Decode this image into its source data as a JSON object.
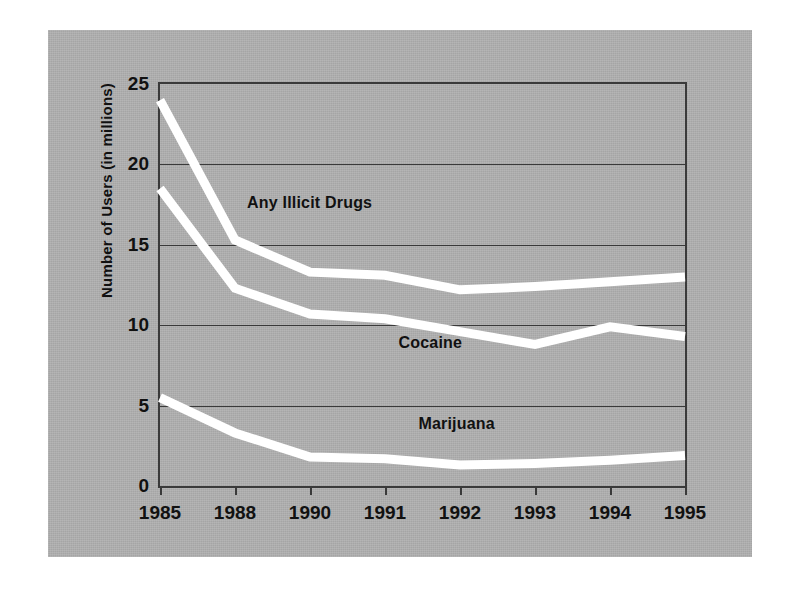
{
  "chart_data": {
    "type": "line",
    "title": "",
    "xlabel": "",
    "ylabel": "Number of Users (in millions)",
    "categories": [
      "1985",
      "1988",
      "1990",
      "1991",
      "1992",
      "1993",
      "1994",
      "1995"
    ],
    "ylim": [
      0,
      25
    ],
    "yticks": [
      0,
      5,
      10,
      15,
      20,
      25
    ],
    "ytick_labels": [
      "0",
      "5",
      "10",
      "15",
      "20",
      "25"
    ],
    "grid": "horizontal",
    "legend_position": "inline-annotations",
    "series": [
      {
        "name": "Any Illicit Drugs",
        "color": "#ffffff",
        "values": [
          24.0,
          15.3,
          13.3,
          13.1,
          12.2,
          12.4,
          12.7,
          13.0
        ]
      },
      {
        "name": "Cocaine",
        "color": "#ffffff",
        "values": [
          18.5,
          12.3,
          10.7,
          10.4,
          9.6,
          8.8,
          9.9,
          9.3
        ]
      },
      {
        "name": "Marijuana",
        "color": "#ffffff",
        "values": [
          5.5,
          3.3,
          1.8,
          1.7,
          1.3,
          1.4,
          1.6,
          1.9
        ]
      }
    ],
    "annotations": [
      {
        "text": "Any Illicit Drugs",
        "x_frac": 0.285,
        "y_frac": 0.295
      },
      {
        "text": "Cocaine",
        "x_frac": 0.515,
        "y_frac": 0.645
      },
      {
        "text": "Marijuana",
        "x_frac": 0.565,
        "y_frac": 0.845
      }
    ]
  }
}
